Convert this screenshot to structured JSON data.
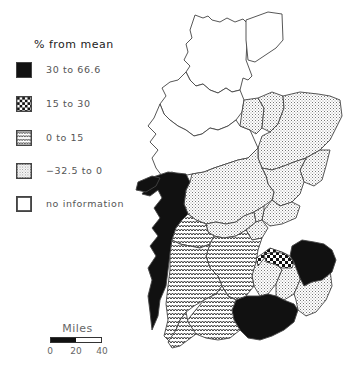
{
  "legend": {
    "title": "% from mean",
    "items": [
      {
        "label": "30 to 66.6",
        "pattern": "solid-black"
      },
      {
        "label": "15 to 30",
        "pattern": "checkerboard"
      },
      {
        "label": "0 to 15",
        "pattern": "zigzag"
      },
      {
        "label": "−32.5 to 0",
        "pattern": "fine-stipple"
      },
      {
        "label": "no information",
        "pattern": "blank"
      }
    ]
  },
  "scale": {
    "title": "Miles",
    "ticks": [
      "0",
      "20",
      "40"
    ]
  },
  "map": {
    "region": "Scotland",
    "categories": {
      "no_information": "northern highlands and islands",
      "neg_32_5_to_0": "north-east and central counties",
      "zero_to_15": "south-west counties",
      "fifteen_to_30": "central-east county near Firth of Forth",
      "thirty_to_66_6": "Argyll west coast, Lothian/Berwick east, Dumfries/Borders south"
    }
  },
  "colors": {
    "ink": "#111111",
    "outline": "#444444",
    "background": "#ffffff"
  }
}
